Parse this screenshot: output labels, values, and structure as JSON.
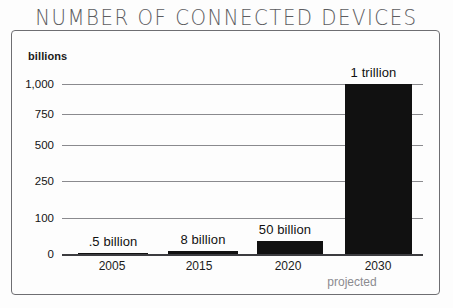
{
  "chart_data": {
    "type": "bar",
    "title": "NUMBER OF CONNECTED DEVICES",
    "xlabel": "",
    "ylabel": "billions",
    "categories": [
      "2005",
      "2015",
      "2020",
      "2030"
    ],
    "values": [
      0.5,
      8,
      50,
      1000
    ],
    "value_labels": [
      ".5 billion",
      "8 billion",
      "50 billion",
      "1 trillion"
    ],
    "ytick_labels": [
      "1,000",
      "750",
      "500",
      "250",
      "100",
      "0"
    ],
    "ytick_values": [
      1000,
      750,
      500,
      250,
      100,
      0
    ],
    "ylim": [
      0,
      1000
    ],
    "grid": true,
    "legend": "none",
    "annotations": [
      {
        "text": "projected",
        "near_category": "2030"
      }
    ],
    "axis_scale_note": "non-linear y-axis spacing",
    "colors": {
      "bar": "#111111",
      "gridline": "#8a8a8e",
      "baseline": "#3c3c40",
      "title": "#5c5c60",
      "frame": "#6e6e72",
      "annotation": "#8b8b90",
      "background": "#fdfdfd"
    }
  },
  "bar_geometry": [
    {
      "category": "2005",
      "left": 16,
      "width": 70,
      "top": 169,
      "height": 1,
      "label_left": 16,
      "label_top": 150
    },
    {
      "category": "2015",
      "left": 106,
      "width": 70,
      "top": 167,
      "height": 3,
      "label_left": 106,
      "label_top": 148
    },
    {
      "category": "2020",
      "left": 195,
      "width": 66,
      "top": 157,
      "height": 13,
      "label_left": 190,
      "label_top": 138
    },
    {
      "category": "2030",
      "left": 283,
      "width": 67,
      "top": 0,
      "height": 170,
      "label_left": 278,
      "label_top": -19
    }
  ],
  "gridline_geometry": [
    {
      "label": "1,000",
      "y": 84
    },
    {
      "label": "750",
      "y": 114
    },
    {
      "label": "500",
      "y": 145
    },
    {
      "label": "250",
      "y": 181
    },
    {
      "label": "100",
      "y": 218
    },
    {
      "label": "0",
      "y": 254
    }
  ],
  "xtick_geometry": [
    {
      "label": "2005",
      "center": 112
    },
    {
      "label": "2015",
      "center": 199
    },
    {
      "label": "2020",
      "center": 288
    },
    {
      "label": "2030",
      "center": 378
    }
  ],
  "projected_geometry": {
    "center": 352
  }
}
